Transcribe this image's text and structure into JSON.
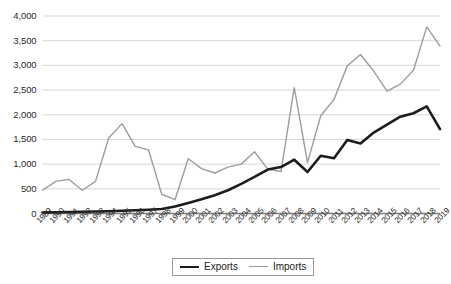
{
  "chart_data": {
    "type": "line",
    "title": "",
    "xlabel": "",
    "ylabel": "",
    "ylim": [
      0,
      4000
    ],
    "ytick_values": [
      0,
      500,
      1000,
      1500,
      2000,
      2500,
      3000,
      3500,
      4000
    ],
    "ytick_labels": [
      "0",
      "500",
      "1,000",
      "1,500",
      "2,000",
      "2,500",
      "3,000",
      "3,500",
      "4,000"
    ],
    "grid": true,
    "legend_position": "bottom",
    "categories": [
      "1989",
      "1990",
      "1991",
      "1992",
      "1993",
      "1994",
      "1995",
      "1996",
      "1997",
      "1998",
      "1999",
      "2000",
      "2001",
      "2002",
      "2003",
      "2004",
      "2005",
      "2006",
      "2007",
      "2008",
      "2009",
      "2010",
      "2011",
      "2012",
      "2013",
      "2014",
      "2015",
      "2016",
      "2017",
      "2018",
      "2019"
    ],
    "series": [
      {
        "name": "Exports",
        "color": "#1c1c1c",
        "line_width": 2.6,
        "values": [
          20,
          25,
          30,
          35,
          40,
          45,
          55,
          65,
          75,
          90,
          140,
          215,
          290,
          370,
          470,
          600,
          740,
          890,
          940,
          1090,
          840,
          1170,
          1120,
          1490,
          1420,
          1640,
          1800,
          1960,
          2030,
          2170,
          1710
        ]
      },
      {
        "name": "Imports",
        "color": "#9d9d9d",
        "line_width": 1.4,
        "values": [
          470,
          650,
          690,
          470,
          650,
          1530,
          1820,
          1360,
          1290,
          390,
          280,
          1110,
          910,
          820,
          940,
          1000,
          1250,
          900,
          850,
          2550,
          1030,
          1980,
          2310,
          2990,
          3220,
          2880,
          2480,
          2620,
          2900,
          3780,
          3390
        ]
      }
    ]
  },
  "legend": {
    "items": [
      {
        "label": "Exports"
      },
      {
        "label": "Imports"
      }
    ]
  }
}
